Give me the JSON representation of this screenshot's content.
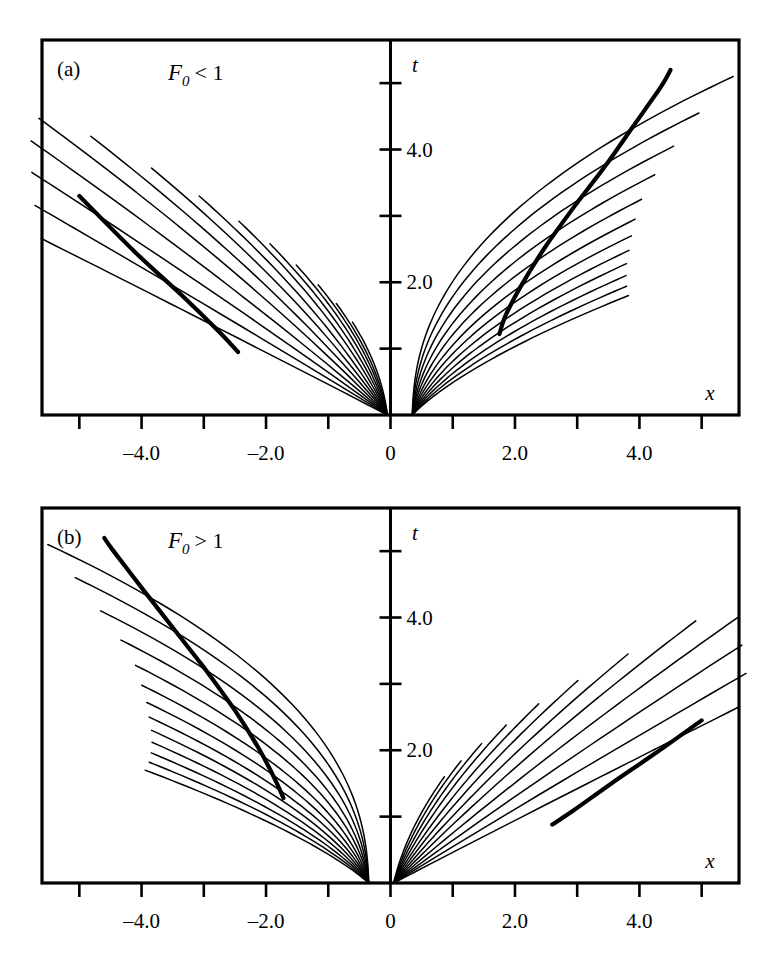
{
  "figure": {
    "panels": [
      {
        "id": "a",
        "letter": "(a)",
        "condition": {
          "symbol": "F",
          "subscript": "0",
          "relation": "< 1",
          "full": "F0 < 1"
        },
        "axis": {
          "x_name": "x",
          "t_name": "t",
          "x_ticks": [
            -5,
            -4,
            -3,
            -2,
            -1,
            0,
            1,
            2,
            3,
            4,
            5
          ],
          "x_tick_labels": [
            {
              "value": -4,
              "label": "–4.0"
            },
            {
              "value": -2,
              "label": "–2.0"
            },
            {
              "value": 0,
              "label": "0"
            },
            {
              "value": 2,
              "label": "2.0"
            },
            {
              "value": 4,
              "label": "4.0"
            }
          ],
          "t_ticks": [
            1,
            2,
            3,
            4,
            5
          ],
          "t_tick_labels": [
            {
              "value": 2,
              "label": "2.0"
            },
            {
              "value": 4,
              "label": "4.0"
            }
          ],
          "xlim": [
            -5.6,
            5.6
          ],
          "tlim": [
            0,
            5.65
          ]
        }
      },
      {
        "id": "b",
        "letter": "(b)",
        "condition": {
          "symbol": "F",
          "subscript": "0",
          "relation": "> 1",
          "full": "F0 > 1"
        },
        "axis": {
          "x_name": "x",
          "t_name": "t",
          "x_ticks": [
            -5,
            -4,
            -3,
            -2,
            -1,
            0,
            1,
            2,
            3,
            4,
            5
          ],
          "x_tick_labels": [
            {
              "value": -4,
              "label": "–4.0"
            },
            {
              "value": -2,
              "label": "–2.0"
            },
            {
              "value": 0,
              "label": "0"
            },
            {
              "value": 2,
              "label": "2.0"
            },
            {
              "value": 4,
              "label": "4.0"
            }
          ],
          "t_ticks": [
            1,
            2,
            3,
            4,
            5
          ],
          "t_tick_labels": [
            {
              "value": 2,
              "label": "2.0"
            },
            {
              "value": 4,
              "label": "4.0"
            }
          ],
          "xlim": [
            -5.6,
            5.6
          ],
          "tlim": [
            0,
            5.65
          ]
        }
      }
    ]
  },
  "chart_data": {
    "type": "line",
    "title": "",
    "xlabel": "x",
    "ylabel": "t",
    "grid": false,
    "legend": null,
    "panels": [
      {
        "id": "a",
        "label": "(a)",
        "annotation": "F0 < 1",
        "xlim": [
          -5.6,
          5.6
        ],
        "ylim": [
          0,
          5.65
        ],
        "cusps": [
          {
            "side": "left",
            "x": -5.0,
            "t": 3.3
          },
          {
            "side": "right",
            "x": 3.0,
            "t": 3.2
          }
        ],
        "caustics": [
          {
            "name": "left-caustic",
            "points": [
              [
                -5.0,
                3.3
              ],
              [
                -4.1,
                2.45
              ],
              [
                -3.35,
                1.8
              ],
              [
                -2.75,
                1.25
              ],
              [
                -2.45,
                0.95
              ]
            ]
          },
          {
            "name": "right-caustic-upper",
            "points": [
              [
                3.0,
                3.2
              ],
              [
                3.45,
                3.75
              ],
              [
                3.9,
                4.35
              ],
              [
                4.35,
                4.95
              ],
              [
                4.5,
                5.2
              ]
            ]
          },
          {
            "name": "right-caustic-lower",
            "points": [
              [
                3.0,
                3.2
              ],
              [
                2.5,
                2.55
              ],
              [
                2.1,
                1.95
              ],
              [
                1.85,
                1.5
              ],
              [
                1.75,
                1.22
              ]
            ]
          }
        ],
        "left_family": {
          "origin_x": -0.05,
          "count": 14,
          "note": "curves launched near x=0 fanning left and downward to the bottom axis, the uppermost ones exiting the left frame edge"
        },
        "right_family": {
          "origin_x": 0.35,
          "count": 12,
          "note": "curves launched near x=0.35 fanning right, converging toward the right cusp region"
        }
      },
      {
        "id": "b",
        "label": "(b)",
        "annotation": "F0 > 1",
        "xlim": [
          -5.6,
          5.6
        ],
        "ylim": [
          0,
          5.65
        ],
        "cusps": [
          {
            "side": "left",
            "x": -3.0,
            "t": 3.25
          },
          {
            "side": "right",
            "x": 5.0,
            "t": 2.45
          }
        ],
        "caustics": [
          {
            "name": "left-caustic-upper",
            "points": [
              [
                -3.0,
                3.25
              ],
              [
                -3.5,
                3.85
              ],
              [
                -4.0,
                4.45
              ],
              [
                -4.45,
                5.0
              ],
              [
                -4.6,
                5.2
              ]
            ]
          },
          {
            "name": "left-caustic-lower",
            "points": [
              [
                -3.0,
                3.25
              ],
              [
                -2.5,
                2.6
              ],
              [
                -2.1,
                2.0
              ],
              [
                -1.85,
                1.55
              ],
              [
                -1.72,
                1.28
              ]
            ]
          },
          {
            "name": "right-caustic",
            "points": [
              [
                5.0,
                2.45
              ],
              [
                4.25,
                1.95
              ],
              [
                3.55,
                1.5
              ],
              [
                2.95,
                1.1
              ],
              [
                2.6,
                0.88
              ]
            ]
          }
        ],
        "left_family": {
          "origin_x": -0.35,
          "count": 13,
          "note": "curves launched near x=-0.35 fanning left, converging toward the left cusp region"
        },
        "right_family": {
          "origin_x": 0.05,
          "count": 12,
          "note": "curves launched near x=0 fanning right and upward toward the right focus"
        }
      }
    ]
  },
  "colors": {
    "ink": "#000000",
    "background": "#ffffff"
  }
}
